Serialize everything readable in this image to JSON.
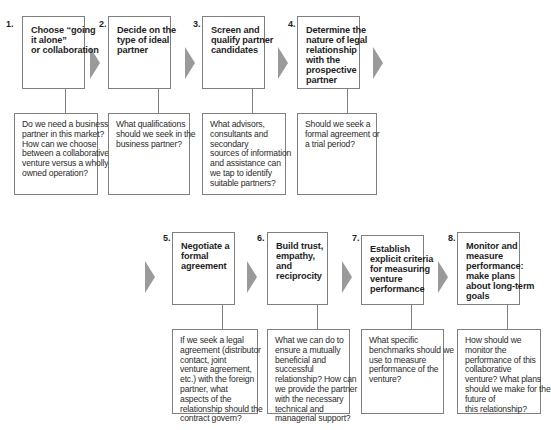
{
  "steps": [
    {
      "number": "1.",
      "title_lines": [
        "Choose “going",
        "it alone”",
        "or collaboration"
      ],
      "question_lines": [
        "Do we need a business",
        "partner in this market?",
        "How can we choose",
        "between a collaborative",
        "venture versus a wholly",
        "owned operation?"
      ]
    },
    {
      "number": "2.",
      "title_lines": [
        "Decide on the",
        "type of ideal",
        "partner"
      ],
      "question_lines": [
        "What qualifications",
        "should we seek in the",
        "business partner?"
      ]
    },
    {
      "number": "3.",
      "title_lines": [
        "Screen and",
        "qualify partner",
        "candidates"
      ],
      "question_lines": [
        "What advisors,",
        "consultants and",
        "secondary",
        "sources of information",
        "and assistance can",
        "we tap to identify",
        "suitable partners?"
      ]
    },
    {
      "number": "4.",
      "title_lines": [
        "Determine the",
        "nature of legal",
        "relationship",
        "with the",
        "prospective",
        "partner"
      ],
      "question_lines": [
        "Should we seek a",
        "formal agreement or",
        "a trial period?"
      ]
    },
    {
      "number": "5.",
      "title_lines": [
        "Negotiate a",
        "formal",
        "agreement"
      ],
      "question_lines": [
        "If we seek a legal",
        "agreement (distributor",
        "contact, joint",
        "venture agreement,",
        "etc.) with the foreign",
        "partner, what",
        "aspects of the",
        "relationship should the",
        "contract govern?"
      ]
    },
    {
      "number": "6.",
      "title_lines": [
        "Build trust,",
        "empathy,",
        "and",
        "reciprocity"
      ],
      "question_lines": [
        "What we can do to",
        "ensure a mutually",
        "beneficial and",
        "successful",
        "relationship? How can",
        "we provide the partner",
        "with the necessary",
        "technical and",
        "managerial support?"
      ]
    },
    {
      "number": "7.",
      "title_lines": [
        "Establish",
        "explicit criteria",
        "for measuring",
        "venture",
        "performance"
      ],
      "question_lines": [
        "What specific",
        "benchmarks should we",
        "use to measure",
        "performance of the",
        "venture?"
      ]
    },
    {
      "number": "8.",
      "title_lines": [
        "Monitor and",
        "measure",
        "performance:",
        "make plans",
        "about long-term",
        "goals"
      ],
      "question_lines": [
        "How should we",
        "monitor the",
        "performance of this",
        "collaborative",
        "venture? What plans",
        "should we make for the",
        "future of",
        "this relationship?"
      ]
    }
  ],
  "colors": {
    "border": "#7f7f7f",
    "arrow": "#9a9a9a",
    "text": "#1e1e1e"
  }
}
